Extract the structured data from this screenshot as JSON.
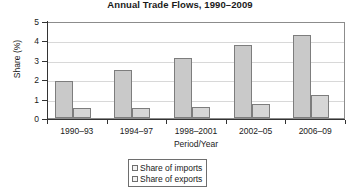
{
  "chart_data": {
    "type": "bar",
    "title": "Annual Trade Flows, 1990–2009",
    "xlabel": "Period/Year",
    "ylabel": "Share (%)",
    "categories": [
      "1990–93",
      "1994–97",
      "1998–2001",
      "2002–05",
      "2006–09"
    ],
    "series": [
      {
        "name": "Share of imports",
        "values": [
          1.9,
          2.5,
          3.1,
          3.75,
          4.3
        ]
      },
      {
        "name": "Share of exports",
        "values": [
          0.5,
          0.5,
          0.55,
          0.7,
          1.2
        ]
      }
    ],
    "ylim": [
      0,
      5
    ],
    "yticks": [
      0,
      1,
      2,
      3,
      4,
      5
    ],
    "ytick_labels": [
      "0",
      "1",
      "2",
      "3",
      "4",
      "5"
    ],
    "grid": true,
    "legend_position": "bottom-center",
    "colors": {
      "imports_fill": "#c9c9c9",
      "exports_fill": "#d6d6d6",
      "bar_border": "#7d7d7d",
      "gridline": "#d8d8d8",
      "axis": "#333333",
      "background": "#ffffff"
    }
  },
  "legend": {
    "items": [
      {
        "label": "Share of imports"
      },
      {
        "label": "Share of exports"
      }
    ]
  }
}
